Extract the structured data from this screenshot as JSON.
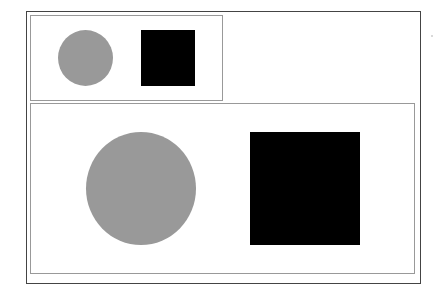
{
  "colors": {
    "circle": "#999999",
    "square": "#000000",
    "frame": "#444444",
    "panel_border": "#999999",
    "background": "#ffffff"
  },
  "panels": [
    {
      "name": "small-preview",
      "shapes": [
        {
          "type": "circle",
          "color": "#999999",
          "x": 58,
          "y": 30,
          "w": 55,
          "h": 56
        },
        {
          "type": "square",
          "color": "#000000",
          "x": 141,
          "y": 30,
          "w": 54,
          "h": 56
        }
      ]
    },
    {
      "name": "large-view",
      "shapes": [
        {
          "type": "circle",
          "color": "#999999",
          "x": 86,
          "y": 132,
          "w": 110,
          "h": 113
        },
        {
          "type": "square",
          "color": "#000000",
          "x": 250,
          "y": 132,
          "w": 110,
          "h": 113
        }
      ]
    }
  ]
}
